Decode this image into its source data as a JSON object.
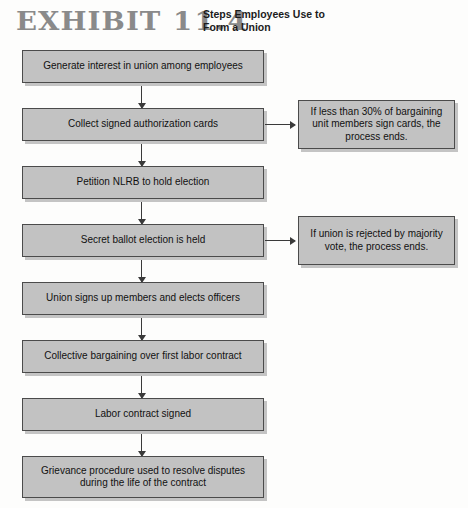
{
  "header": {
    "exhibit_word": "EXHIBIT",
    "exhibit_number": "11.4",
    "title": "Steps Employees Use to Form a Union"
  },
  "colors": {
    "box_fill": "#c2c2c2",
    "box_border": "#4b4b4b",
    "shadow": "#969696",
    "exhibit_label": "#8a8a8a",
    "connector": "#3a3a3a",
    "page_background": "#fdfdfc",
    "text": "#111111"
  },
  "flow": {
    "steps": [
      {
        "id": "step-1",
        "label": "Generate interest in union among employees"
      },
      {
        "id": "step-2",
        "label": "Collect signed authorization cards"
      },
      {
        "id": "step-3",
        "label": "Petition NLRB to hold election"
      },
      {
        "id": "step-4",
        "label": "Secret ballot election is held"
      },
      {
        "id": "step-5",
        "label": "Union signs up members and elects officers"
      },
      {
        "id": "step-6",
        "label": "Collective bargaining over first labor contract"
      },
      {
        "id": "step-7",
        "label": "Labor contract signed"
      },
      {
        "id": "step-8",
        "label": "Grievance procedure used to resolve disputes during the life of the contract"
      }
    ],
    "side_notes": [
      {
        "id": "side-note-1",
        "from_step": "step-2",
        "label": "If less than 30% of bargaining unit members sign cards, the process ends."
      },
      {
        "id": "side-note-2",
        "from_step": "step-4",
        "label": "If union is rejected by majority vote, the process ends."
      }
    ]
  }
}
